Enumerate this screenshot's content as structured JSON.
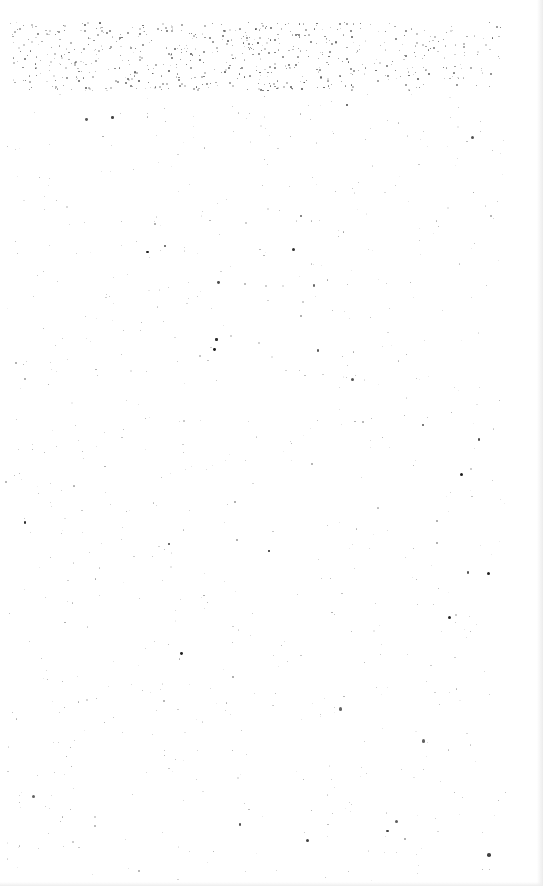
{
  "page": {
    "background": "#ffffff",
    "content": "",
    "noise": {
      "color": "#000000",
      "dense_band": {
        "top": 22,
        "bottom": 90
      },
      "density_top": 900,
      "density_body": 700
    }
  }
}
